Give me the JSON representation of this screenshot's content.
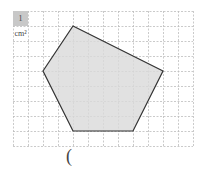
{
  "diagram": {
    "unit_label": "1 cm²",
    "answer_paren": "(",
    "grid": {
      "x0": 13,
      "y0": 11,
      "cell": 15,
      "cols": 12,
      "rows": 9,
      "line_color": "#bdbdbd"
    },
    "shape": {
      "type": "pentagon",
      "vertices_grid": [
        [
          4,
          1
        ],
        [
          10,
          4
        ],
        [
          8,
          8
        ],
        [
          4,
          8
        ],
        [
          2,
          4
        ]
      ],
      "fill": "#d9d9d9",
      "stroke": "#333333"
    }
  }
}
